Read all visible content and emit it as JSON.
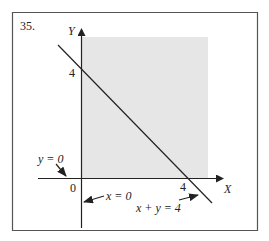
{
  "figure": {
    "number": "35.",
    "axis_x_label": "X",
    "axis_y_label": "Y",
    "origin_label": "0",
    "x_intercept_label": "4",
    "y_intercept_label": "4",
    "annotations": {
      "y_axis_eq": "y = 0",
      "x_axis_eq": "x = 0",
      "line_eq": "x + y = 4"
    },
    "colors": {
      "shade": "#e6e6e6",
      "ink": "#222222",
      "border": "#555555"
    }
  }
}
